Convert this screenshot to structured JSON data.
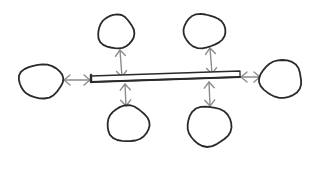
{
  "diagram": {
    "style": "hand-drawn sketch",
    "colors": {
      "background": "#ffffff",
      "stroke": "#2a2a2a",
      "arrow": "#8c8c8c"
    },
    "bus": {
      "x1": 91,
      "y1": 79,
      "x2": 240,
      "y2": 74,
      "thickness": 6
    },
    "nodes": [
      {
        "id": "node-top-left",
        "cx": 116,
        "cy": 32,
        "rx": 18,
        "ry": 17
      },
      {
        "id": "node-top-right",
        "cx": 204,
        "cy": 31,
        "rx": 21,
        "ry": 17
      },
      {
        "id": "node-left",
        "cx": 41,
        "cy": 81,
        "rx": 22,
        "ry": 17
      },
      {
        "id": "node-right",
        "cx": 281,
        "cy": 79,
        "rx": 21,
        "ry": 19
      },
      {
        "id": "node-bottom-left",
        "cx": 128,
        "cy": 124,
        "rx": 21,
        "ry": 18
      },
      {
        "id": "node-bottom-right",
        "cx": 209,
        "cy": 126,
        "rx": 22,
        "ry": 20
      }
    ],
    "connections": [
      {
        "from": "node-top-left",
        "to": "bus",
        "type": "bidirectional",
        "x1": 120,
        "y1": 50,
        "x2": 122,
        "y2": 77
      },
      {
        "from": "node-top-right",
        "to": "bus",
        "type": "bidirectional",
        "x1": 210,
        "y1": 48,
        "x2": 212,
        "y2": 74
      },
      {
        "from": "node-left",
        "to": "bus",
        "type": "bidirectional",
        "x1": 64,
        "y1": 80,
        "x2": 90,
        "y2": 80
      },
      {
        "from": "node-right",
        "to": "bus",
        "type": "bidirectional",
        "x1": 241,
        "y1": 77,
        "x2": 260,
        "y2": 77
      },
      {
        "from": "node-bottom-left",
        "to": "bus",
        "type": "bidirectional",
        "x1": 125,
        "y1": 84,
        "x2": 126,
        "y2": 106
      },
      {
        "from": "node-bottom-right",
        "to": "bus",
        "type": "bidirectional",
        "x1": 209,
        "y1": 82,
        "x2": 210,
        "y2": 106
      }
    ]
  }
}
